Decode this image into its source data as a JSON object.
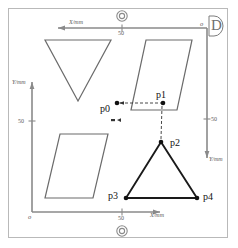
{
  "figure": {
    "width": 238,
    "height": 248,
    "background": "#ffffff",
    "frame_color": "#b9b9b9",
    "corner_tag": "D"
  },
  "axes": {
    "top": {
      "name": "top-x-axis",
      "label": "X/mm",
      "tick_label": "50",
      "direction": "left",
      "origin_label": "o"
    },
    "left": {
      "name": "left-y-axis",
      "label": "Y/mm",
      "tick_label": "50",
      "direction": "up"
    },
    "bottom": {
      "name": "bottom-x-axis",
      "label": "X/mm",
      "tick_label": "50",
      "direction": "right",
      "origin_label": "o"
    },
    "right": {
      "name": "right-y-axis",
      "label": "Y/mm",
      "tick_label": "50",
      "direction": "down"
    }
  },
  "registration_marks": [
    {
      "name": "registration-mark-top",
      "shape": "double-circle"
    },
    {
      "name": "registration-mark-bottom",
      "shape": "double-circle"
    }
  ],
  "points": [
    {
      "id": "p0",
      "label": "p0",
      "x": 117,
      "y": 103,
      "filled": true
    },
    {
      "id": "p1",
      "label": "p1",
      "x": 163,
      "y": 103,
      "filled": true
    },
    {
      "id": "p2",
      "label": "p2",
      "x": 161,
      "y": 142,
      "filled": true
    },
    {
      "id": "p3",
      "label": "p3",
      "x": 126,
      "y": 198,
      "filled": true
    },
    {
      "id": "p4",
      "label": "p4",
      "x": 197,
      "y": 198,
      "filled": true
    }
  ],
  "shapes": [
    {
      "name": "inverted-triangle-upper-left",
      "type": "polygon",
      "stroke": "#6b6b6b",
      "points": "45,40 111,40 78,101"
    },
    {
      "name": "parallelogram-upper-right",
      "type": "polygon",
      "stroke": "#6b6b6b",
      "points": "146,40 192,40 177,110 131,110"
    },
    {
      "name": "parallelogram-lower-left",
      "type": "polygon",
      "stroke": "#6b6b6b",
      "points": "60,134 108,134 93,198 45,198"
    },
    {
      "name": "triangle-lower-right",
      "type": "polygon",
      "stroke": "#1a1a1a",
      "points": "161,142 197,198 126,198"
    }
  ],
  "connectors": [
    {
      "name": "dashed-arrow-p0-to-p1",
      "style": "dashed",
      "from": "p0",
      "to": "p1",
      "color": "#333333"
    },
    {
      "name": "dashed-arrow-p1-to-p2",
      "style": "dashed",
      "from": "p1",
      "to": "p2",
      "color": "#333333"
    }
  ],
  "markers": [
    {
      "name": "double-dash-marker",
      "glyph": "▪◂"
    }
  ]
}
